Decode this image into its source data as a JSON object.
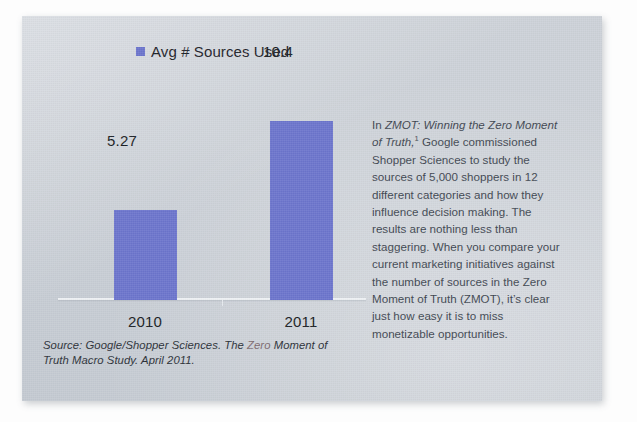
{
  "slide": {
    "background_color": "#ccd1d8",
    "accent_color": "#6b74cc",
    "text_color": "#3e4650"
  },
  "legend": {
    "marker": "legend-swatch",
    "label": "Avg # Sources Used"
  },
  "chart_data": {
    "type": "bar",
    "title": "",
    "subtitle": "",
    "xlabel": "",
    "ylabel": "",
    "categories": [
      "2010",
      "2011"
    ],
    "values": [
      5.27,
      10.4
    ],
    "value_labels": [
      "5.27",
      "10.4"
    ],
    "series": [
      {
        "name": "Avg # Sources Used",
        "values": [
          5.27,
          10.4
        ],
        "color": "#6b74cc"
      }
    ],
    "ylim": [
      0,
      12
    ],
    "grid": false,
    "legend_position": "top-left",
    "axis_visible": true,
    "annotations": []
  },
  "source_note": {
    "part1": "Source: Google/Shopper Sciences. The ",
    "highlight": "Zero",
    "part2": " Moment of Truth Macro Study. April 2011."
  },
  "body_copy": {
    "lead": "In ",
    "title_italic": "ZMOT: Winning the Zero Moment of Truth,",
    "footnote_marker": "1",
    "rest": " Google commissioned Shopper Sciences to study the sources of 5,000 shoppers in 12 different categories and how they influence decision making. The results are nothing less than staggering. When you compare your current marketing initiatives against the number of sources in the Zero Moment of Truth (ZMOT), it’s clear just how easy it is to miss monetizable opportunities."
  }
}
